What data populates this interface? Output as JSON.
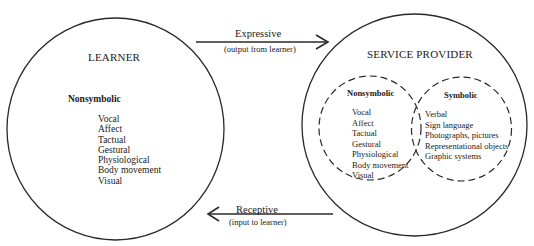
{
  "learner": {
    "title": "LEARNER",
    "heading": "Nonsymbolic",
    "items": [
      "Vocal",
      "Affect",
      "Tactual",
      "Gestural",
      "Physiological",
      "Body movement",
      "Visual"
    ]
  },
  "service_provider": {
    "title": "SERVICE PROVIDER",
    "nonsymbolic": {
      "heading": "Nonsymbolic",
      "items": [
        "Vocal",
        "Affect",
        "Tactual",
        "Gestural",
        "Physiological",
        "Body movement",
        "Visual"
      ]
    },
    "symbolic": {
      "heading": "Symbolic",
      "items": [
        "Verbal",
        "Sign language",
        "Photographs, pictures",
        "Representational objects",
        "Graphic systems"
      ]
    }
  },
  "arrows": {
    "expressive": {
      "label": "Expressive",
      "sub": "(output from learner)",
      "direction": "right"
    },
    "receptive": {
      "label": "Receptive",
      "sub": "(input to learner)",
      "direction": "left"
    }
  },
  "colors": {
    "line": "#2a2a2a",
    "background": "#ffffff"
  }
}
